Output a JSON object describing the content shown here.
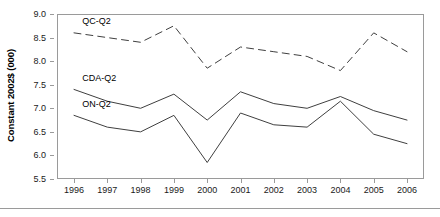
{
  "chart_data": {
    "type": "line",
    "title": "",
    "xlabel": "",
    "ylabel": "Constant 2002$ (000)",
    "categories": [
      "1996",
      "1997",
      "1998",
      "1999",
      "2000",
      "2001",
      "2002",
      "2003",
      "2004",
      "2005",
      "2006"
    ],
    "x": [
      1996,
      1997,
      1998,
      1999,
      2000,
      2001,
      2002,
      2003,
      2004,
      2005,
      2006
    ],
    "ylim": [
      5.5,
      9.0
    ],
    "xlim": [
      1996,
      2006
    ],
    "ytick_labels": [
      "9.0",
      "8.5",
      "8.0",
      "7.5",
      "7.0",
      "6.5",
      "6.0",
      "5.5"
    ],
    "ytick_values": [
      9.0,
      8.5,
      8.0,
      7.5,
      7.0,
      6.5,
      6.0,
      5.5
    ],
    "grid": false,
    "legend_position": "inline-labels",
    "series": [
      {
        "name": "QC-Q2",
        "style": "dashed",
        "color": "#3f3f3f",
        "label_x": 1996.25,
        "label_y": 8.82,
        "values": [
          8.6,
          8.5,
          8.4,
          8.75,
          7.85,
          8.3,
          8.2,
          8.1,
          7.8,
          8.6,
          8.2
        ]
      },
      {
        "name": "CDA-Q2",
        "style": "solid",
        "color": "#3f3f3f",
        "label_x": 1996.25,
        "label_y": 7.62,
        "values": [
          7.4,
          7.15,
          7.0,
          7.3,
          6.75,
          7.35,
          7.1,
          7.0,
          7.25,
          6.95,
          6.75
        ]
      },
      {
        "name": "ON-Q2",
        "style": "solid",
        "color": "#3f3f3f",
        "label_x": 1996.25,
        "label_y": 7.08,
        "values": [
          6.85,
          6.6,
          6.5,
          6.85,
          5.85,
          6.9,
          6.65,
          6.6,
          7.15,
          6.45,
          6.25
        ]
      }
    ]
  }
}
